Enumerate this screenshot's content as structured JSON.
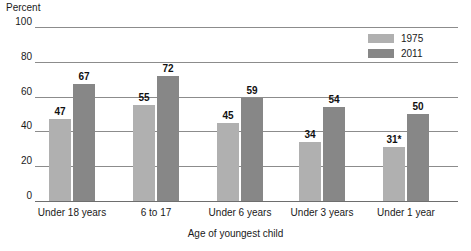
{
  "chart_data": {
    "type": "bar",
    "title": "",
    "ylabel": "Percent",
    "xlabel": "Age of youngest child",
    "ylim": [
      0,
      100
    ],
    "yticks": [
      0,
      20,
      40,
      60,
      80,
      100
    ],
    "ytick_labels": [
      "0",
      "20",
      "40",
      "60",
      "80",
      "100"
    ],
    "grid": true,
    "legend_position": "top-right",
    "categories": [
      "Under 18 years",
      "6 to 17",
      "Under 6 years",
      "Under 3 years",
      "Under 1 year"
    ],
    "series": [
      {
        "name": "1975",
        "color": "#b0b0b0",
        "values": [
          47,
          55,
          45,
          34,
          31
        ],
        "value_labels": [
          "47",
          "55",
          "45",
          "34",
          "31*"
        ]
      },
      {
        "name": "2011",
        "color": "#878787",
        "values": [
          67,
          72,
          59,
          54,
          50
        ],
        "value_labels": [
          "67",
          "72",
          "59",
          "54",
          "50"
        ]
      }
    ],
    "annotations": [
      "* value 31 is marked with an asterisk"
    ]
  },
  "legend": {
    "items": [
      {
        "label": "1975",
        "color": "#b0b0b0"
      },
      {
        "label": "2011",
        "color": "#878787"
      }
    ]
  }
}
